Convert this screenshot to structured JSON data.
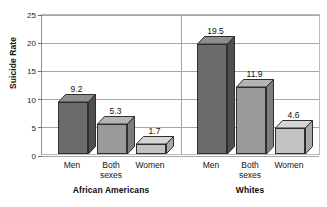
{
  "figure": {
    "cropped_title": "",
    "background": "#ffffff"
  },
  "chart_data": {
    "type": "bar",
    "title": "",
    "xlabel": "",
    "ylabel": "Suicide Rate",
    "ylim": [
      0,
      25
    ],
    "yticks": [
      0,
      5,
      10,
      15,
      20,
      25
    ],
    "ytick_labels": [
      "0",
      "5",
      "10",
      "15",
      "20",
      "25"
    ],
    "grid": true,
    "legend": "none",
    "style": "3d-grouped-bar",
    "groups": [
      "African Americans",
      "Whites"
    ],
    "categories": [
      "Men",
      "Both sexes",
      "Women"
    ],
    "series": [
      {
        "name": "African Americans",
        "values": [
          9.2,
          5.3,
          1.7
        ]
      },
      {
        "name": "Whites",
        "values": [
          19.5,
          11.9,
          4.6
        ]
      }
    ],
    "bars": [
      {
        "group": "African Americans",
        "category": "Men",
        "value": 9.2,
        "label": "9.2",
        "shade": "dark"
      },
      {
        "group": "African Americans",
        "category": "Both sexes",
        "value": 5.3,
        "label": "5.3",
        "shade": "medium"
      },
      {
        "group": "African Americans",
        "category": "Women",
        "value": 1.7,
        "label": "1.7",
        "shade": "light"
      },
      {
        "group": "Whites",
        "category": "Men",
        "value": 19.5,
        "label": "19.5",
        "shade": "dark"
      },
      {
        "group": "Whites",
        "category": "Both sexes",
        "value": 11.9,
        "label": "11.9",
        "shade": "medium"
      },
      {
        "group": "Whites",
        "category": "Women",
        "value": 4.6,
        "label": "4.6",
        "shade": "light"
      }
    ],
    "colors": {
      "dark_front": "#6b6b6b",
      "dark_top": "#8d8d8d",
      "dark_side": "#4f4f4f",
      "medium_front": "#9a9a9a",
      "medium_top": "#b4b4b4",
      "medium_side": "#7d7d7d",
      "light_front": "#c2c2c2",
      "light_top": "#d6d6d6",
      "light_side": "#a8a8a8",
      "grid": "#a6a6a6",
      "axis": "#8e8e8e",
      "text": "#111111"
    }
  },
  "axis": {
    "y_title": "Suicide Rate"
  },
  "categories_display": [
    {
      "line1": "Men",
      "line2": ""
    },
    {
      "line1": "Both",
      "line2": "sexes"
    },
    {
      "line1": "Women",
      "line2": ""
    }
  ],
  "group_labels": [
    {
      "text": "African Americans"
    },
    {
      "text": "Whites"
    }
  ],
  "tick_labels": [
    "25",
    "20",
    "15",
    "10",
    "5",
    "0"
  ],
  "bar_labels": [
    "9.2",
    "5.3",
    "1.7",
    "19.5",
    "11.9",
    "4.6"
  ]
}
